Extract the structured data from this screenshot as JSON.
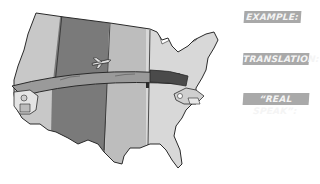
{
  "illustration": {
    "subject": "map of the United States divided into four vertical time-zone bands with a banner arrow spanning west to east",
    "zones": [
      {
        "name": "pacific",
        "color": "#c8c8c8"
      },
      {
        "name": "mountain",
        "color": "#7a7a7a"
      },
      {
        "name": "central",
        "color": "#bdbdbd"
      },
      {
        "name": "eastern",
        "color": "#d8d8d8"
      }
    ],
    "banner_color": "#9a9a9a",
    "banner_dark_color": "#4a4a4a",
    "figures": [
      "west-coast-character",
      "airplane",
      "east-coast-character"
    ]
  },
  "labels": {
    "example": "EXAMPLE:",
    "translation": "TRANSLATION:",
    "real_speak": "“REAL SPEAK”:"
  },
  "colors": {
    "label_bg": "#a9a9a9",
    "label_text": "#f4f4f4",
    "outline": "#2a2a2a"
  }
}
